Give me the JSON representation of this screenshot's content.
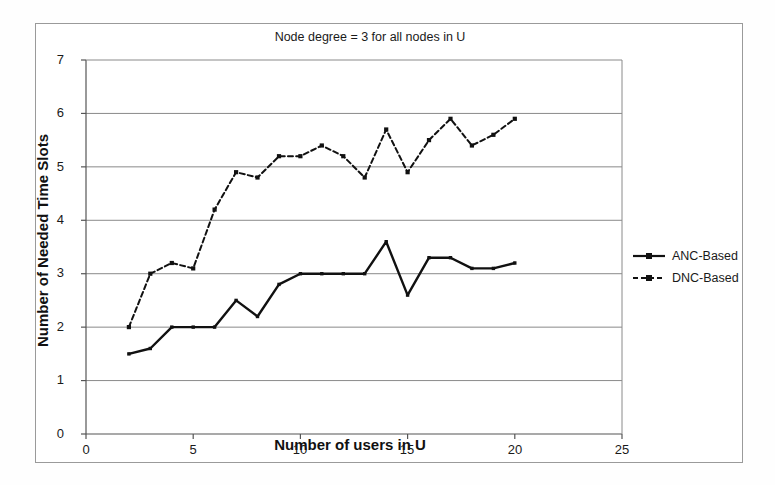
{
  "chart_data": {
    "type": "line",
    "title": "Node degree = 3 for all nodes in U",
    "xlabel": "Number of users in U",
    "ylabel": "Number of Needed Time Slots",
    "xlim": [
      0,
      25
    ],
    "ylim": [
      0,
      7
    ],
    "xticks": [
      0,
      5,
      10,
      15,
      20,
      25
    ],
    "yticks": [
      0,
      1,
      2,
      3,
      4,
      5,
      6,
      7
    ],
    "grid": "horizontal",
    "legend_position": "right",
    "x": [
      2,
      3,
      4,
      5,
      6,
      7,
      8,
      9,
      10,
      11,
      12,
      13,
      14,
      15,
      16,
      17,
      18,
      19,
      20
    ],
    "series": [
      {
        "name": "ANC-Based",
        "style": "solid",
        "marker": "square",
        "color": "#111111",
        "values": [
          1.5,
          1.6,
          2.0,
          2.0,
          2.0,
          2.5,
          2.2,
          2.8,
          3.0,
          3.0,
          3.0,
          3.0,
          3.6,
          2.6,
          3.3,
          3.3,
          3.1,
          3.1,
          3.2
        ]
      },
      {
        "name": "DNC-Based",
        "style": "dashed",
        "marker": "square",
        "color": "#111111",
        "values": [
          2.0,
          3.0,
          3.2,
          3.1,
          4.2,
          4.9,
          4.8,
          5.2,
          5.2,
          5.4,
          5.2,
          4.8,
          5.7,
          4.9,
          5.5,
          5.9,
          5.4,
          5.6,
          5.9
        ]
      }
    ]
  },
  "axes": {
    "y_tick_labels": [
      "7",
      "6",
      "5",
      "4",
      "3",
      "2",
      "1",
      "0"
    ],
    "x_tick_labels": [
      "0",
      "5",
      "10",
      "15",
      "20",
      "25"
    ]
  },
  "legend": {
    "entries": [
      {
        "label": "ANC-Based"
      },
      {
        "label": "DNC-Based"
      }
    ]
  },
  "colors": {
    "line": "#111111",
    "grid": "#8a8a8a",
    "frame": "#9a9a9a",
    "axis": "#555555",
    "text": "#1a1a1a",
    "background": "#ffffff"
  }
}
